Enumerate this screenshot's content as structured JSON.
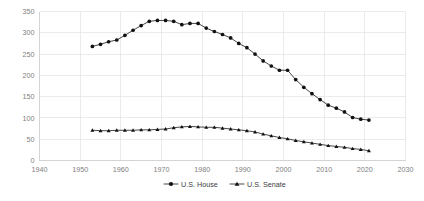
{
  "chart_data": {
    "type": "line",
    "title": "",
    "subtitle": "",
    "xlabel": "",
    "ylabel": "",
    "xlim": [
      1940,
      2030
    ],
    "ylim": [
      0,
      350
    ],
    "xticks": [
      1940,
      1950,
      1960,
      1970,
      1980,
      1990,
      2000,
      2010,
      2020,
      2030
    ],
    "yticks": [
      0,
      50,
      100,
      150,
      200,
      250,
      300,
      350
    ],
    "grid": true,
    "legend_position": "bottom",
    "series": [
      {
        "name": "U.S. House",
        "marker": "circle",
        "color": "#111111",
        "x": [
          1953,
          1955,
          1957,
          1959,
          1961,
          1963,
          1965,
          1967,
          1969,
          1971,
          1973,
          1975,
          1977,
          1979,
          1981,
          1983,
          1985,
          1987,
          1989,
          1991,
          1993,
          1995,
          1997,
          1999,
          2001,
          2003,
          2005,
          2007,
          2009,
          2011,
          2013,
          2015,
          2017,
          2019,
          2021
        ],
        "values": [
          268,
          273,
          279,
          283,
          294,
          306,
          317,
          327,
          329,
          329,
          327,
          319,
          322,
          322,
          311,
          303,
          296,
          288,
          275,
          265,
          250,
          234,
          222,
          212,
          212,
          190,
          172,
          157,
          143,
          130,
          123,
          114,
          101,
          97,
          95
        ],
        "values_note": "Read from gridlines; 50-unit spacing"
      },
      {
        "name": "U.S. Senate",
        "marker": "triangle",
        "color": "#111111",
        "x": [
          1953,
          1955,
          1957,
          1959,
          1961,
          1963,
          1965,
          1967,
          1969,
          1971,
          1973,
          1975,
          1977,
          1979,
          1981,
          1983,
          1985,
          1987,
          1989,
          1991,
          1993,
          1995,
          1997,
          1999,
          2001,
          2003,
          2005,
          2007,
          2009,
          2011,
          2013,
          2015,
          2017,
          2019,
          2021
        ],
        "values": [
          71,
          70,
          70,
          71,
          71,
          71,
          72,
          72,
          73,
          74,
          77,
          79,
          80,
          79,
          78,
          78,
          76,
          74,
          72,
          70,
          67,
          62,
          58,
          54,
          51,
          47,
          44,
          41,
          38,
          35,
          33,
          31,
          28,
          26,
          23
        ],
        "values_note": "Read from gridlines; 50-unit spacing"
      }
    ],
    "legend": [
      {
        "label": "U.S. House",
        "marker": "circle"
      },
      {
        "label": "U.S. Senate",
        "marker": "triangle"
      }
    ]
  }
}
